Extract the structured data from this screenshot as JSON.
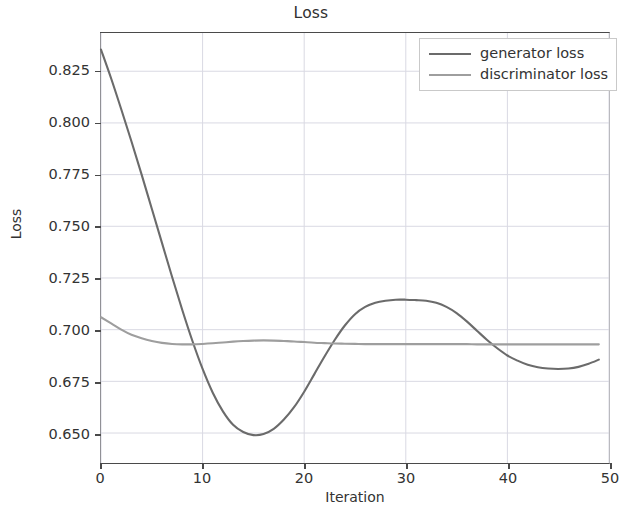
{
  "chart_data": {
    "type": "line",
    "title": "Loss",
    "xlabel": "Iteration",
    "ylabel": "Loss",
    "xlim": [
      0,
      50
    ],
    "ylim": [
      0.6355,
      0.8435
    ],
    "grid": true,
    "legend_position": "upper right",
    "xticks": [
      0,
      10,
      20,
      30,
      40,
      50
    ],
    "xtick_labels": [
      "0",
      "10",
      "20",
      "30",
      "40",
      "50"
    ],
    "yticks": [
      0.65,
      0.675,
      0.7,
      0.725,
      0.75,
      0.775,
      0.8,
      0.825
    ],
    "ytick_labels": [
      "0.650",
      "0.675",
      "0.700",
      "0.725",
      "0.750",
      "0.775",
      "0.800",
      "0.825"
    ],
    "x": [
      0,
      1,
      2,
      3,
      4,
      5,
      6,
      7,
      8,
      9,
      10,
      11,
      12,
      13,
      14,
      15,
      16,
      17,
      18,
      19,
      20,
      21,
      22,
      23,
      24,
      25,
      26,
      27,
      28,
      29,
      30,
      31,
      32,
      33,
      34,
      35,
      36,
      37,
      38,
      39,
      40,
      41,
      42,
      43,
      44,
      45,
      46,
      47,
      48,
      49
    ],
    "series": [
      {
        "name": "generator loss",
        "color": "#6b6b6b",
        "values": [
          0.8355,
          0.8215,
          0.8065,
          0.791,
          0.775,
          0.7585,
          0.742,
          0.7255,
          0.7095,
          0.6945,
          0.681,
          0.6695,
          0.6605,
          0.654,
          0.6505,
          0.649,
          0.6495,
          0.652,
          0.6565,
          0.6625,
          0.67,
          0.6785,
          0.687,
          0.695,
          0.702,
          0.7075,
          0.711,
          0.713,
          0.714,
          0.7145,
          0.7145,
          0.7143,
          0.714,
          0.713,
          0.711,
          0.708,
          0.704,
          0.6995,
          0.695,
          0.691,
          0.6875,
          0.685,
          0.683,
          0.6818,
          0.6812,
          0.681,
          0.6812,
          0.682,
          0.6835,
          0.6855
        ]
      },
      {
        "name": "discriminator loss",
        "color": "#9e9e9e",
        "values": [
          0.706,
          0.703,
          0.7,
          0.6975,
          0.6958,
          0.6945,
          0.6936,
          0.6931,
          0.6929,
          0.6929,
          0.6931,
          0.6934,
          0.6938,
          0.6942,
          0.6945,
          0.6947,
          0.6948,
          0.6947,
          0.6945,
          0.6943,
          0.694,
          0.6937,
          0.6935,
          0.6933,
          0.6932,
          0.6931,
          0.693,
          0.693,
          0.693,
          0.693,
          0.693,
          0.693,
          0.693,
          0.693,
          0.693,
          0.693,
          0.693,
          0.6929,
          0.6929,
          0.6929,
          0.6929,
          0.6929,
          0.6929,
          0.6929,
          0.6929,
          0.6929,
          0.6929,
          0.6929,
          0.6929,
          0.6929
        ]
      }
    ],
    "annotations": []
  },
  "legend": {
    "entries": [
      {
        "label": "generator loss"
      },
      {
        "label": "discriminator loss"
      }
    ]
  },
  "style": {
    "grid_color": "#d9d9e3",
    "axis_color": "#4a4a4a",
    "background": "#ffffff"
  }
}
